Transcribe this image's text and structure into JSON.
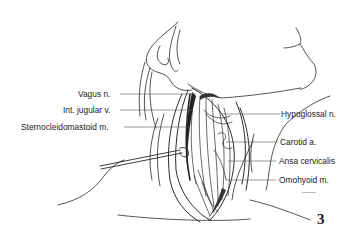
{
  "figure": {
    "number": "3",
    "type": "anatomical line illustration"
  },
  "labels": {
    "left": [
      {
        "id": "vagus",
        "text": "Vagus n."
      },
      {
        "id": "int_jugular",
        "text": "Int. jugular v."
      },
      {
        "id": "scm",
        "text": "Sternocleidomastoid m."
      }
    ],
    "right": [
      {
        "id": "hypoglossal",
        "text": "Hypoglossal n."
      },
      {
        "id": "carotid",
        "text": "Carotid a."
      },
      {
        "id": "ansa",
        "text": "Ansa cervicalis"
      },
      {
        "id": "omohyoid",
        "text": "Omohyoid m."
      }
    ]
  },
  "colors": {
    "ink": "#1a1a1a",
    "background": "#ffffff"
  }
}
